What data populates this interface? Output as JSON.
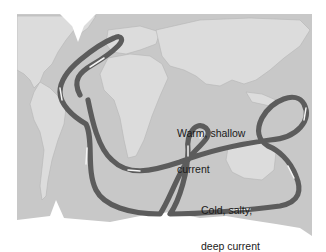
{
  "figure": {
    "labels": {
      "warm": {
        "line1": "Warm, shallow",
        "line2": "current"
      },
      "cold": {
        "line1": "Cold, salty,",
        "line2": "deep current"
      }
    },
    "colors": {
      "ocean": "#c9c9c9",
      "land": "#dedede",
      "ice": "#ffffff",
      "current_stroke": "#5a5a5a",
      "current_highlight": "#f2f2f2",
      "text": "#1a1a1a"
    },
    "legend": [
      {
        "name": "warm-shallow-current",
        "label": "Warm, shallow current"
      },
      {
        "name": "cold-deep-current",
        "label": "Cold, salty, deep current"
      }
    ]
  }
}
